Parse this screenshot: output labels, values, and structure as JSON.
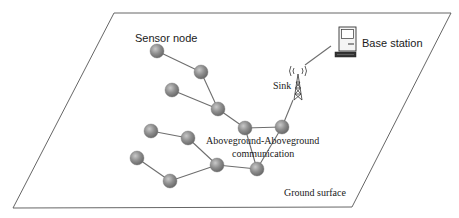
{
  "diagram": {
    "type": "wireless sensor network",
    "plane_label": "Ground surface",
    "labels": {
      "sensor_node": "Sensor node",
      "base_station": "Base station",
      "sink": "Sink",
      "communication_line1": "Aboveground-Aboveground",
      "communication_line2": "communication"
    },
    "colors": {
      "node_fill": "#8a8a8a",
      "node_highlight": "#c4c4c4",
      "edge": "#6e6e6e",
      "outline": "#555555",
      "text": "#1a1a1a"
    },
    "plane": {
      "corners": [
        [
          114,
          13
        ],
        [
          451,
          13
        ],
        [
          352,
          207
        ],
        [
          13,
          208
        ]
      ]
    },
    "nodes": [
      {
        "id": "n1",
        "x": 157,
        "y": 51
      },
      {
        "id": "n2",
        "x": 201,
        "y": 72
      },
      {
        "id": "n3",
        "x": 172,
        "y": 90
      },
      {
        "id": "n4",
        "x": 218,
        "y": 109
      },
      {
        "id": "n5",
        "x": 245,
        "y": 128
      },
      {
        "id": "n6",
        "x": 282,
        "y": 127
      },
      {
        "id": "n7",
        "x": 151,
        "y": 131
      },
      {
        "id": "n8",
        "x": 188,
        "y": 138
      },
      {
        "id": "n9",
        "x": 137,
        "y": 158
      },
      {
        "id": "n10",
        "x": 217,
        "y": 165
      },
      {
        "id": "n11",
        "x": 257,
        "y": 169
      },
      {
        "id": "n12",
        "x": 170,
        "y": 181
      }
    ],
    "edges": [
      [
        "n1",
        "n2"
      ],
      [
        "n2",
        "n4"
      ],
      [
        "n3",
        "n4"
      ],
      [
        "n4",
        "n5"
      ],
      [
        "n5",
        "n6"
      ],
      [
        "n5",
        "n11"
      ],
      [
        "n6",
        "n11"
      ],
      [
        "n10",
        "n11"
      ],
      [
        "n7",
        "n8"
      ],
      [
        "n8",
        "n10"
      ],
      [
        "n9",
        "n12"
      ],
      [
        "n12",
        "n10"
      ]
    ],
    "sink": {
      "x": 298,
      "y": 86
    },
    "base_station": {
      "x": 347,
      "y": 40
    }
  }
}
